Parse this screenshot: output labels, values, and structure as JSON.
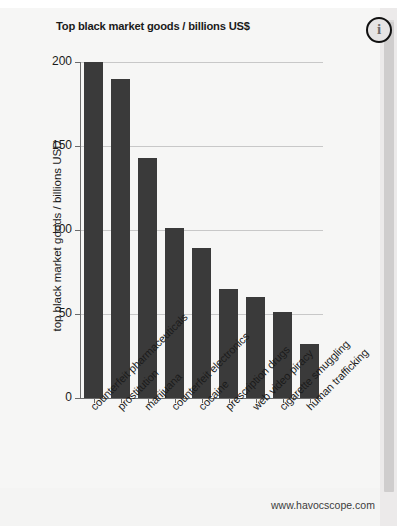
{
  "window": {
    "background_color": "#f4f4f3",
    "page_color": "#f6f6f5"
  },
  "info_button": {
    "icon": "info-circle-icon",
    "glyph": "i"
  },
  "scrollbar": {
    "orientation": "vertical",
    "track_color": "#eceaea",
    "thumb_color": "#cfcdcd"
  },
  "footer": {
    "url": "www.havocscope.com"
  },
  "chart_data": {
    "type": "bar",
    "title": "Top black market goods / billions US$",
    "xlabel": "",
    "ylabel": "top black market goods / billions USD",
    "ylim": [
      0,
      200
    ],
    "yticks": [
      0,
      50,
      100,
      150,
      200
    ],
    "ytick_labels": [
      "0",
      "50",
      "100",
      "150",
      "200"
    ],
    "grid": true,
    "legend": false,
    "bar_color": "#3a3a3a",
    "categories": [
      "counterfeit pharmaceuticals",
      "prostitution",
      "marijuana",
      "counterfeit electronics",
      "cocaine",
      "prescription drugs",
      "web video piracy",
      "cigarette smuggling",
      "human trafficking"
    ],
    "values": [
      200,
      190,
      143,
      101,
      89,
      65,
      60,
      51,
      32
    ]
  }
}
